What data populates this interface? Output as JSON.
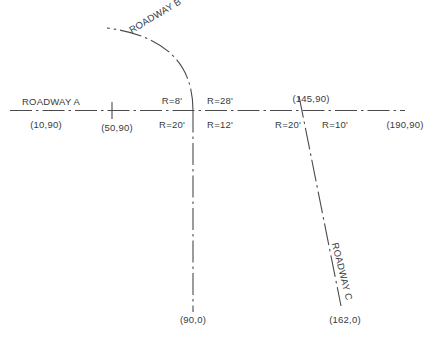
{
  "drawing": {
    "title": "Roadway Intersection Centerline Diagram",
    "background_color": "#ffffff",
    "line_color": "#4a4a4a",
    "text_color": "#3a3a3a"
  },
  "roadways": {
    "a": {
      "name": "ROADWAY A",
      "style": "dash-dot centerline",
      "orientation": "horizontal"
    },
    "b": {
      "name": "ROADWAY B",
      "style": "dash-dot centerline",
      "orientation": "vertical with curve"
    },
    "c": {
      "name": "ROADWAY C",
      "style": "dash-dot centerline",
      "orientation": "diagonal"
    }
  },
  "stations": {
    "a_left": "(10,90)",
    "a_tick": "(50,90)",
    "a_center_right": "(145,90)",
    "a_right": "(190,90)",
    "b_bottom": "(90,0)",
    "c_bottom": "(162,0)"
  },
  "radii": {
    "b_nw_upper": "R=8'",
    "b_sw_lower": "R=20'",
    "b_ne_upper": "R=28'",
    "b_se_lower": "R=12'",
    "c_sw_lower": "R=20'",
    "c_se_lower": "R=10'"
  }
}
